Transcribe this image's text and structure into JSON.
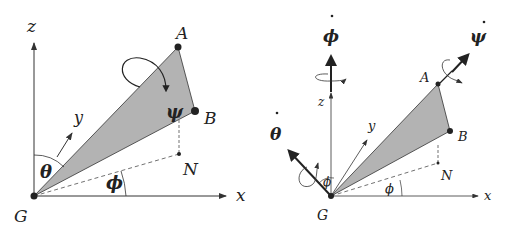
{
  "left": {
    "axes": {
      "z": "z",
      "y": "y",
      "x": "x"
    },
    "points": {
      "A": "A",
      "B": "B",
      "N": "N",
      "G": "G"
    },
    "angles": {
      "theta": "θ",
      "phi": "ϕ",
      "psi": "ψ"
    }
  },
  "right": {
    "axes": {
      "z": "z",
      "y": "y",
      "x": "x"
    },
    "points": {
      "A": "A",
      "B": "B",
      "N": "N",
      "G": "G"
    },
    "angles": {
      "phi_small": "ϕ",
      "phi_base": "ϕ"
    },
    "rates": {
      "phi_dot": "ϕ",
      "theta_dot": "θ",
      "psi_dot": "ψ"
    }
  },
  "colors": {
    "fill": "#b3b3b3",
    "line": "#333333",
    "point": "#222222"
  }
}
